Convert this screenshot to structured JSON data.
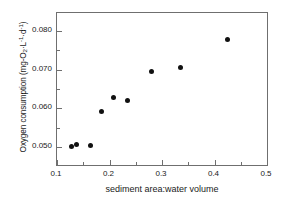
{
  "chart_data": {
    "type": "scatter",
    "title": "",
    "xlabel": "sediment area:water volume",
    "ylabel": "Oxygen consumption (mg-O2 L-1 d-1)",
    "ylabel_parts": {
      "prefix": "Oxygen consumption (mg-O",
      "o2_sub": "2",
      "mid": "·L",
      "l_sup": "-1",
      "mid2": "·d",
      "d_sup": "-1",
      "suffix": ")"
    },
    "xlim": [
      0.1,
      0.5
    ],
    "ylim": [
      0.0455,
      0.0845
    ],
    "xticks": [
      0.1,
      0.2,
      0.3,
      0.4,
      0.5
    ],
    "xtick_labels": [
      "0.1",
      "0.2",
      "0.3",
      "0.4",
      "0.5"
    ],
    "xticks_minor": [
      0.15,
      0.25,
      0.35,
      0.45
    ],
    "yticks": [
      0.05,
      0.06,
      0.07,
      0.08
    ],
    "ytick_labels": [
      "0.050",
      "0.060",
      "0.070",
      "0.080"
    ],
    "yticks_minor": [
      0.055,
      0.065,
      0.075
    ],
    "grid": false,
    "legend": false,
    "marker": "filled-circle",
    "marker_color": "#111111",
    "axis_color": "#6f6f6f",
    "background": "#ffffff",
    "x": [
      0.127,
      0.138,
      0.164,
      0.185,
      0.208,
      0.234,
      0.28,
      0.336,
      0.425
    ],
    "y": [
      0.0503,
      0.0508,
      0.0505,
      0.0592,
      0.0628,
      0.0621,
      0.0694,
      0.0706,
      0.0778
    ],
    "points": [
      {
        "x": 0.127,
        "y": 0.0503
      },
      {
        "x": 0.138,
        "y": 0.0508
      },
      {
        "x": 0.164,
        "y": 0.0505
      },
      {
        "x": 0.185,
        "y": 0.0592
      },
      {
        "x": 0.208,
        "y": 0.0628
      },
      {
        "x": 0.234,
        "y": 0.0621
      },
      {
        "x": 0.28,
        "y": 0.0694
      },
      {
        "x": 0.336,
        "y": 0.0706
      },
      {
        "x": 0.425,
        "y": 0.0778
      }
    ]
  }
}
